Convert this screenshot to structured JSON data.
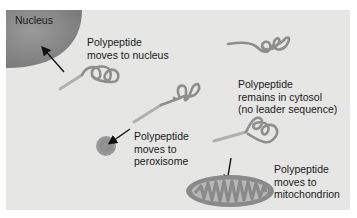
{
  "figure": {
    "type": "diagram",
    "colors": {
      "background": "#e6e6e4",
      "nucleus": "#8a8a8a",
      "polypeptide": "#8e8e8e",
      "leader_sequence": "#b0b0b0",
      "arrow": "#111111",
      "text": "#1a1a1a"
    }
  },
  "structures": {
    "nucleus": {
      "label": "Nucleus"
    },
    "peroxisome": {
      "label": ""
    },
    "mitochondrion": {
      "label": ""
    }
  },
  "labels": {
    "nucleus_path": "Polypeptide\nmoves to nucleus",
    "cytosol_path": "Polypeptide\nremains in cytosol\n(no leader sequence)",
    "peroxisome_path": "Polypeptide\nmoves to\nperoxisome",
    "mitochondrion_path": "Polypeptide\nmoves to\nmitochondrion"
  }
}
